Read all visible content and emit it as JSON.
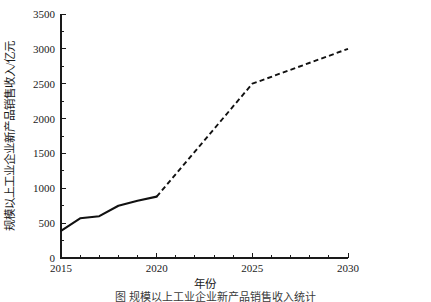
{
  "chart_data": {
    "type": "line",
    "title": "",
    "xlabel": "年份",
    "ylabel": "规模以上工业企业新产品销售收入/亿元",
    "xlim": [
      2015,
      2030
    ],
    "ylim": [
      0,
      3500
    ],
    "xticks": [
      2015,
      2020,
      2025,
      2030
    ],
    "xtick_labels": [
      "2015",
      "2020",
      "2025",
      "2030"
    ],
    "yticks": [
      0,
      500,
      1000,
      1500,
      2000,
      2500,
      3000,
      3500
    ],
    "ytick_labels": [
      "0",
      "500",
      "1000",
      "1500",
      "2000",
      "2500",
      "3000",
      "3500"
    ],
    "x_minor_tick_interval": 1,
    "y_minor_tick_interval": 250,
    "grid": false,
    "legend": false,
    "series": [
      {
        "name": "历史值",
        "style": "solid",
        "color": "#111111",
        "x": [
          2015,
          2016,
          2017,
          2018,
          2019,
          2020
        ],
        "values": [
          390,
          570,
          600,
          750,
          820,
          880
        ]
      },
      {
        "name": "预测值",
        "style": "dashed",
        "color": "#111111",
        "x": [
          2020,
          2025,
          2030
        ],
        "values": [
          880,
          2500,
          3000
        ]
      }
    ]
  },
  "caption": {
    "text": "图    规模以上工业企业新产品销售收入统计"
  }
}
